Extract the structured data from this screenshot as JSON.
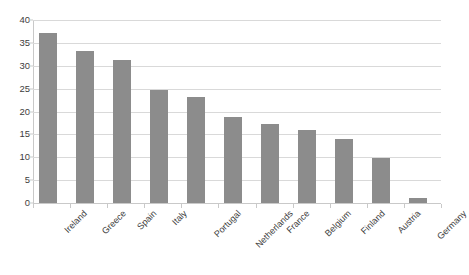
{
  "chart_data": {
    "type": "bar",
    "title": "",
    "subtitle": "",
    "xlabel": "",
    "ylabel": "",
    "categories": [
      "Ireland",
      "Greece",
      "Spain",
      "Italy",
      "Portugal",
      "Netherlands",
      "France",
      "Belgium",
      "Finland",
      "Austria",
      "Germany"
    ],
    "values": [
      37.2,
      33.2,
      31.2,
      24.7,
      23.1,
      18.7,
      17.3,
      16.0,
      14.0,
      9.8,
      1.0
    ],
    "series": [
      {
        "name": "",
        "values": [
          37.2,
          33.2,
          31.2,
          24.7,
          23.1,
          18.7,
          17.3,
          16.0,
          14.0,
          9.8,
          1.0
        ]
      }
    ],
    "ylim": [
      0,
      40
    ],
    "ytick_values": [
      0,
      5,
      10,
      15,
      20,
      25,
      30,
      35,
      40
    ],
    "ytick_labels": [
      "0",
      "5",
      "10",
      "15",
      "20",
      "25",
      "30",
      "35",
      "40"
    ],
    "grid": true,
    "grid_axis": "y",
    "legend": false,
    "legend_position": "none",
    "bar_color": "#8c8c8c",
    "gridline_color": "#d9d9d9",
    "axis_color": "#c9c9c9",
    "text_color": "#3c3c3c",
    "background_color": "#ffffff",
    "xlabel_rotation": -45,
    "annotations": []
  }
}
